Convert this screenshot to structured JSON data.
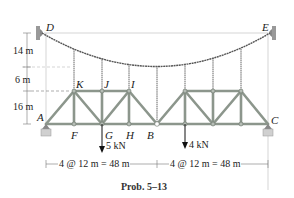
{
  "figure": {
    "caption": "Prob. 5–13",
    "points": {
      "D": "D",
      "E": "E",
      "K": "K",
      "J": "J",
      "I": "I",
      "A": "A",
      "F": "F",
      "G": "G",
      "H": "H",
      "B": "B",
      "C": "C"
    },
    "dimensions": {
      "vertical": [
        "14 m",
        "6 m",
        "16 m"
      ],
      "left_span": "4 @ 12 m = 48 m",
      "right_span": "4 @ 12 m = 48 m"
    },
    "loads": [
      {
        "label": "5 kN",
        "at": "G"
      },
      {
        "label": "4 kN",
        "at": "right truss second bottom joint"
      }
    ],
    "colors": {
      "member": "#9aa39a",
      "member_edge": "#6b746b",
      "cable": "#555555",
      "dim_line": "#777777",
      "support": "#bfbfbf"
    }
  }
}
